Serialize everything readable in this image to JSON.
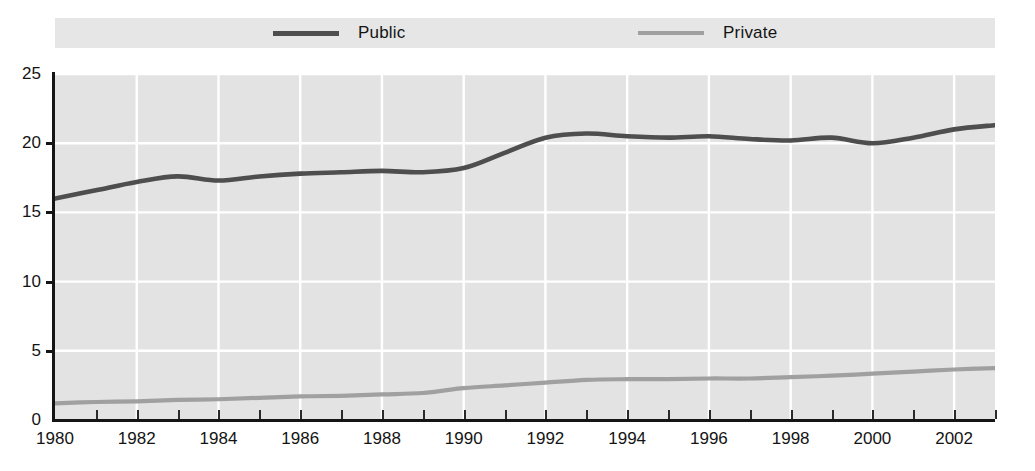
{
  "chart_data": {
    "type": "line",
    "title": "",
    "subtitle": "",
    "xlabel": "",
    "ylabel": "",
    "xlim": [
      1980,
      2003
    ],
    "ylim": [
      0,
      25
    ],
    "grid": true,
    "legend_position": "top",
    "x": [
      1980,
      1981,
      1982,
      1983,
      1984,
      1985,
      1986,
      1987,
      1988,
      1989,
      1990,
      1991,
      1992,
      1993,
      1994,
      1995,
      1996,
      1997,
      1998,
      1999,
      2000,
      2001,
      2002,
      2003
    ],
    "series": [
      {
        "name": "Public",
        "color": "#4e4e4e",
        "values": [
          16.0,
          16.6,
          17.2,
          17.6,
          17.3,
          17.6,
          17.8,
          17.9,
          18.0,
          17.9,
          18.2,
          19.3,
          20.4,
          20.7,
          20.5,
          20.4,
          20.5,
          20.3,
          20.2,
          20.4,
          20.0,
          20.4,
          21.0,
          21.3
        ]
      },
      {
        "name": "Private",
        "color": "#a0a0a0",
        "values": [
          1.2,
          1.3,
          1.35,
          1.45,
          1.5,
          1.6,
          1.7,
          1.75,
          1.85,
          1.95,
          2.3,
          2.5,
          2.7,
          2.9,
          2.95,
          2.95,
          3.0,
          3.0,
          3.1,
          3.2,
          3.35,
          3.5,
          3.65,
          3.75
        ]
      }
    ],
    "y_ticks": [
      0,
      5,
      10,
      15,
      20,
      25
    ],
    "y_tick_labels": [
      "0",
      "5",
      "10",
      "15",
      "20",
      "25"
    ],
    "x_ticks": [
      1980,
      1982,
      1984,
      1986,
      1988,
      1990,
      1992,
      1994,
      1996,
      1998,
      2000,
      2002
    ],
    "x_tick_labels": [
      "1980",
      "1982",
      "1984",
      "1986",
      "1988",
      "1990",
      "1992",
      "1994",
      "1996",
      "1998",
      "2000",
      "2002"
    ],
    "x_minor_ticks": [
      1981,
      1983,
      1985,
      1987,
      1989,
      1991,
      1993,
      1995,
      1997,
      1999,
      2001,
      2003
    ]
  },
  "legend": {
    "public_label": "Public",
    "private_label": "Private"
  },
  "colors": {
    "public_line": "#4e4e4e",
    "private_line": "#a0a0a0",
    "plot_background": "#e3e3e3",
    "legend_background": "#e6e6e6",
    "gridline": "#ffffff",
    "axis": "#151515",
    "text": "#141414"
  }
}
